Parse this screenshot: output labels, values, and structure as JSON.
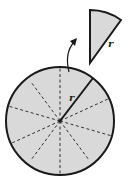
{
  "diagram": {
    "colors": {
      "fill": "#d9d9d9",
      "stroke": "#1a1a1a",
      "background": "#ffffff"
    },
    "circle": {
      "sectors": 8,
      "radius_label": "r"
    },
    "removed_sector": {
      "side_label": "r"
    },
    "arrow": "curved-arrow-up"
  }
}
